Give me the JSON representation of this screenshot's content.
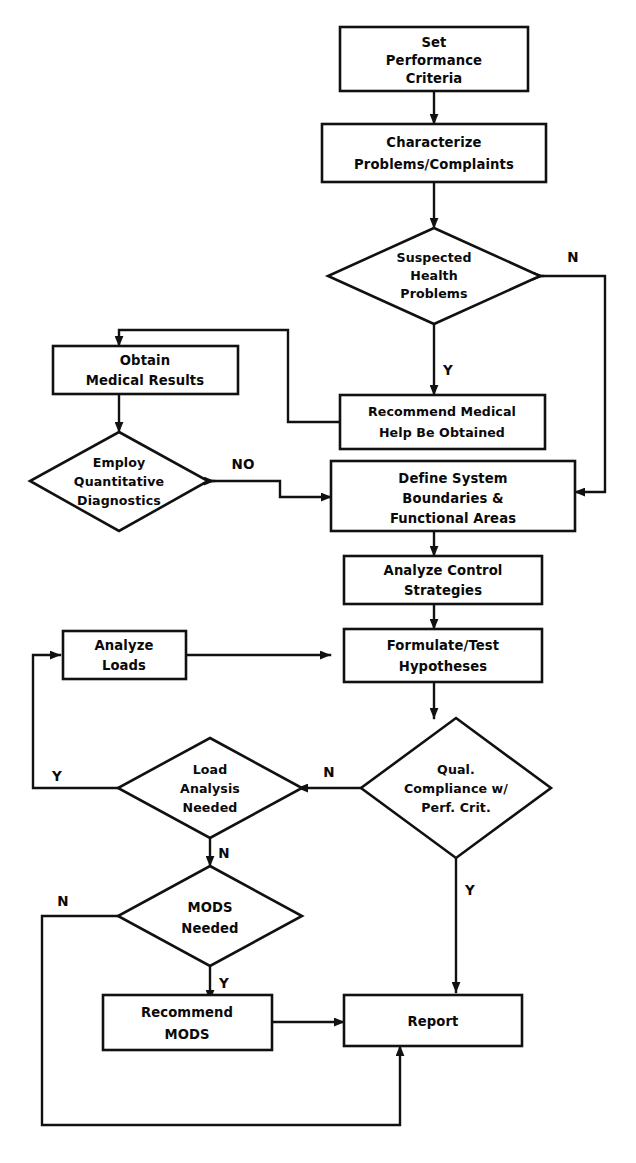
{
  "diagram": {
    "type": "flowchart",
    "colors": {
      "stroke": "#111111",
      "fill": "#ffffff",
      "text": "#0a0a0a"
    }
  },
  "nodes": {
    "set_performance_criteria": {
      "shape": "process",
      "lines": [
        "Set",
        "Performance",
        "Criteria"
      ]
    },
    "characterize_problems": {
      "shape": "process",
      "lines": [
        "Characterize",
        "Problems/Complaints"
      ]
    },
    "suspected_health": {
      "shape": "decision",
      "lines": [
        "Suspected",
        "Health",
        "Problems"
      ]
    },
    "recommend_medical": {
      "shape": "process",
      "lines": [
        "Recommend Medical",
        "Help Be Obtained"
      ]
    },
    "obtain_medical_results": {
      "shape": "process",
      "lines": [
        "Obtain",
        "Medical Results"
      ]
    },
    "employ_quantitative": {
      "shape": "decision",
      "lines": [
        "Employ",
        "Quantitative",
        "Diagnostics"
      ]
    },
    "define_system": {
      "shape": "process",
      "lines": [
        "Define System",
        "Boundaries &",
        "Functional Areas"
      ]
    },
    "analyze_control": {
      "shape": "process",
      "lines": [
        "Analyze Control",
        "Strategies"
      ]
    },
    "formulate_test": {
      "shape": "process",
      "lines": [
        "Formulate/Test",
        "Hypotheses"
      ]
    },
    "analyze_loads": {
      "shape": "process",
      "lines": [
        "Analyze",
        "Loads"
      ]
    },
    "load_analysis_needed": {
      "shape": "decision",
      "lines": [
        "Load",
        "Analysis",
        "Needed"
      ]
    },
    "qual_compliance": {
      "shape": "decision",
      "lines": [
        "Qual.",
        "Compliance w/",
        "Perf. Crit."
      ]
    },
    "mods_needed": {
      "shape": "decision",
      "lines": [
        "MODS",
        "Needed"
      ]
    },
    "recommend_mods": {
      "shape": "process",
      "lines": [
        "Recommend",
        "MODS"
      ]
    },
    "report": {
      "shape": "process",
      "lines": [
        "Report"
      ]
    }
  },
  "edge_labels": {
    "suspected_no": "N",
    "suspected_yes": "Y",
    "employ_no": "NO",
    "qual_no": "N",
    "qual_yes": "Y",
    "load_yes": "Y",
    "load_no": "N",
    "mods_no": "N",
    "mods_yes": "Y"
  },
  "edges": [
    {
      "from": "set_performance_criteria",
      "to": "characterize_problems",
      "label": ""
    },
    {
      "from": "characterize_problems",
      "to": "suspected_health",
      "label": ""
    },
    {
      "from": "suspected_health",
      "to": "define_system",
      "label": "N"
    },
    {
      "from": "suspected_health",
      "to": "recommend_medical",
      "label": "Y"
    },
    {
      "from": "recommend_medical",
      "to": "obtain_medical_results",
      "label": ""
    },
    {
      "from": "obtain_medical_results",
      "to": "employ_quantitative",
      "label": ""
    },
    {
      "from": "employ_quantitative",
      "to": "define_system",
      "label": "NO"
    },
    {
      "from": "define_system",
      "to": "analyze_control",
      "label": ""
    },
    {
      "from": "analyze_control",
      "to": "formulate_test",
      "label": ""
    },
    {
      "from": "formulate_test",
      "to": "qual_compliance",
      "label": ""
    },
    {
      "from": "qual_compliance",
      "to": "load_analysis_needed",
      "label": "N"
    },
    {
      "from": "qual_compliance",
      "to": "report",
      "label": "Y"
    },
    {
      "from": "load_analysis_needed",
      "to": "analyze_loads",
      "label": "Y"
    },
    {
      "from": "load_analysis_needed",
      "to": "mods_needed",
      "label": "N"
    },
    {
      "from": "analyze_loads",
      "to": "formulate_test",
      "label": ""
    },
    {
      "from": "mods_needed",
      "to": "report",
      "label": "N"
    },
    {
      "from": "mods_needed",
      "to": "recommend_mods",
      "label": "Y"
    },
    {
      "from": "recommend_mods",
      "to": "report",
      "label": ""
    }
  ]
}
